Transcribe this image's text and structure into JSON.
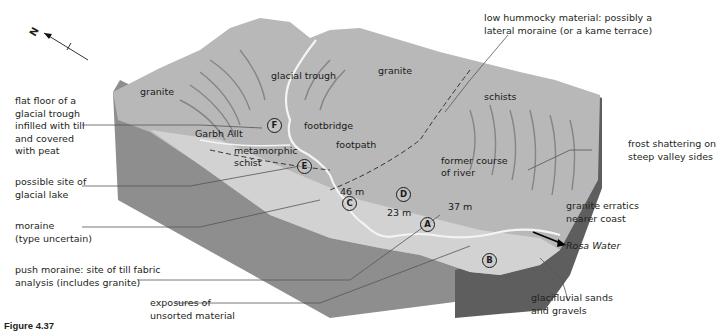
{
  "figure": {
    "caption": "Figure 4.37",
    "north_arrow": "N"
  },
  "callouts_left": [
    {
      "id": "flat-floor",
      "lines": [
        "flat floor of a",
        "glacial trough",
        "infilled with till",
        "and covered",
        "with peat"
      ]
    },
    {
      "id": "glacial-lake",
      "lines": [
        "possible site of",
        "glacial lake"
      ]
    },
    {
      "id": "moraine",
      "lines": [
        "moraine",
        "(type uncertain)"
      ]
    },
    {
      "id": "push-moraine",
      "lines": [
        "push moraine: site of till fabric",
        "analysis (includes granite)"
      ]
    },
    {
      "id": "exposures",
      "lines": [
        "exposures of",
        "unsorted material"
      ]
    }
  ],
  "callouts_right": [
    {
      "id": "hummocky",
      "lines": [
        "low hummocky material: possibly a",
        "lateral moraine (or a kame terrace)"
      ]
    },
    {
      "id": "frost",
      "lines": [
        "frost shattering on",
        "steep valley sides"
      ]
    },
    {
      "id": "erratics",
      "lines": [
        "granite erratics",
        "nearer coast"
      ]
    },
    {
      "id": "rosa",
      "lines": [
        "Rosa Water"
      ]
    },
    {
      "id": "glacifluvial",
      "lines": [
        "glacifluvial sands",
        "and gravels"
      ]
    }
  ],
  "map_labels": {
    "granite_left": "granite",
    "glacial_trough": "glacial trough",
    "granite_right": "granite",
    "schists": "schists",
    "garbh_allt": "Garbh Allt",
    "footbridge": "footbridge",
    "footpath": "footpath",
    "metamorphic": "metamorphic",
    "schist": "schist",
    "former_course_1": "former course",
    "former_course_2": "of river",
    "elev_46": "46 m",
    "elev_23": "23 m",
    "elev_37": "37 m"
  },
  "sites": [
    "A",
    "B",
    "C",
    "D",
    "E",
    "F"
  ],
  "colors": {
    "surface": "#b8b8b8",
    "side_front": "#8e8e8e",
    "side_right": "#5e5e5e",
    "floor": "#d2d2d2",
    "river": "#f4f4f4",
    "leader": "#555555"
  }
}
